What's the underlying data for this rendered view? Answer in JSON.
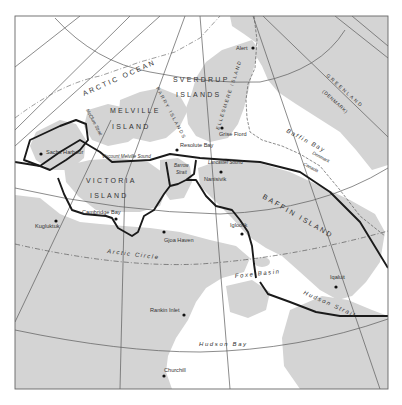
{
  "map": {
    "colors": {
      "land": "#d4d4d4",
      "water": "#ffffff",
      "route": "#1a1a1a",
      "graticule": "#5a5a5a",
      "frame": "#666666",
      "text": "#333333"
    },
    "regions": {
      "arctic_ocean": "ARCTIC OCEAN",
      "sverdrup": "SVERDRUP",
      "islands": "ISLANDS",
      "melville": "MELVILLE",
      "melville_island": "ISLAND",
      "victoria": "VICTORIA",
      "victoria_island": "ISLAND",
      "parry_islands": "PARRY ISLANDS",
      "ellesmere_island": "ELLESMERE ISLAND",
      "greenland": "GREENLAND",
      "denmark": "(DENMARK)",
      "baffin_island": "BAFFIN ISLAND"
    },
    "water_bodies": {
      "baffin_bay": "Baffin Bay",
      "mcclure_strait": "McClure Strait",
      "viscount_melville_sound": "Viscount Melville Sound",
      "barrow_strait_1": "Barrow",
      "barrow_strait_2": "Strait",
      "lancaster_sound": "Lancaster Sound",
      "foxe_basin": "Foxe Basin",
      "hudson_strait": "Hudson Strait",
      "hudson_bay": "Hudson Bay",
      "arctic_circle": "Arctic Circle"
    },
    "boundary": {
      "denmark": "Denmark",
      "canada": "Canada"
    },
    "settlements": [
      {
        "name": "Alert",
        "x": 253,
        "y": 48
      },
      {
        "name": "Grise Fiord",
        "x": 222,
        "y": 128
      },
      {
        "name": "Resolute Bay",
        "x": 177,
        "y": 150
      },
      {
        "name": "Sachs Harbour",
        "x": 41,
        "y": 154
      },
      {
        "name": "Nanisivik",
        "x": 221,
        "y": 172
      },
      {
        "name": "Cambridge Bay",
        "x": 116,
        "y": 219
      },
      {
        "name": "Kugluktuk",
        "x": 56,
        "y": 221
      },
      {
        "name": "Gjoa Haven",
        "x": 164,
        "y": 232
      },
      {
        "name": "Igloolik",
        "x": 242,
        "y": 234
      },
      {
        "name": "Iqaluit",
        "x": 336,
        "y": 287
      },
      {
        "name": "Rankin Inlet",
        "x": 184,
        "y": 315
      },
      {
        "name": "Churchill",
        "x": 164,
        "y": 376
      }
    ]
  }
}
